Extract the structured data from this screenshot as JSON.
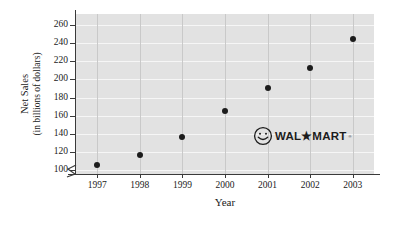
{
  "chart_data": {
    "type": "scatter",
    "title": "",
    "xlabel": "Year",
    "ylabel": "Net Sales (in billions of dollars)",
    "ylabel_line1": "Net Sales",
    "ylabel_line2": "(in billions of dollars)",
    "categories": [
      1997,
      1998,
      1999,
      2000,
      2001,
      2002,
      2003
    ],
    "x": [
      1997,
      1998,
      1999,
      2000,
      2001,
      2002,
      2003
    ],
    "values": [
      106,
      117,
      137,
      165,
      191,
      213,
      244
    ],
    "xtick_labels": [
      "1997",
      "1998",
      "1999",
      "2000",
      "2001",
      "2002",
      "2003"
    ],
    "ytick_labels": [
      "100",
      "120",
      "140",
      "160",
      "180",
      "200",
      "220",
      "240",
      "260"
    ],
    "yticks": [
      100,
      120,
      140,
      160,
      180,
      200,
      220,
      240,
      260
    ],
    "ylim": [
      96,
      272
    ],
    "xlim": [
      1996.5,
      2003.5
    ],
    "grid": true,
    "legend": "none",
    "axis_break": true,
    "series": [
      {
        "name": "Net Sales",
        "points": [
          {
            "x": 1997,
            "y": 106
          },
          {
            "x": 1998,
            "y": 117
          },
          {
            "x": 1999,
            "y": 137
          },
          {
            "x": 2000,
            "y": 165
          },
          {
            "x": 2001,
            "y": 191
          },
          {
            "x": 2002,
            "y": 213
          },
          {
            "x": 2003,
            "y": 244
          }
        ]
      }
    ],
    "colors": {
      "plot_background": "#e2e2e2",
      "gridline_horizontal": "#f6f6f6",
      "gridline_vertical": "#c9c9c9",
      "marker": "#1c1c1c",
      "axis": "#3a3a3a",
      "text": "#1a1a1a"
    }
  },
  "annotations": {
    "brand_logo": {
      "name": "wal-mart-logo",
      "text": "WAL★MART",
      "trademark": "®",
      "icon": "smiley-face-icon"
    }
  }
}
